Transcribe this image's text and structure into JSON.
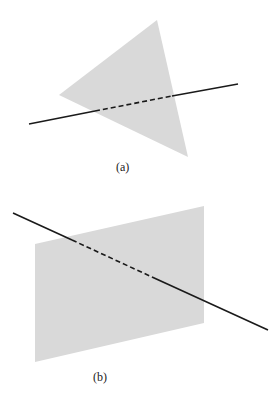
{
  "figures": [
    {
      "id": "a",
      "label": "(a)",
      "shape": "triangle",
      "description": "line piercing a triangular plane"
    },
    {
      "id": "b",
      "label": "(b)",
      "shape": "parallelogram",
      "description": "line piercing a rectangular plane"
    }
  ],
  "colors": {
    "plane_fill": "#d9d9d9",
    "line": "#1a1a1a"
  }
}
